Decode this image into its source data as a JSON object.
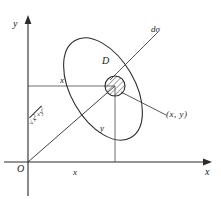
{
  "figure": {
    "type": "math-diagram",
    "axes": {
      "x_label": "x",
      "y_label": "y",
      "origin_label": "O"
    },
    "labels": {
      "region": "D",
      "area_element": "dσ",
      "point": "(x, y)",
      "x_projection": "x",
      "x_axis_segment": "x",
      "y_projection": "y",
      "radius_sqrt": "√",
      "radius_body_x": "x",
      "radius_body_y": "y",
      "radius_exp": "2",
      "radius_plus": "+",
      "radius_full": "√(x²+y²)"
    },
    "colors": {
      "stroke": "#2b2b2b",
      "thin_stroke": "#555555",
      "background": "#ffffff",
      "hatch": "#333333"
    },
    "geometry": {
      "origin": [
        28,
        162
      ],
      "point_xy": [
        115,
        86
      ],
      "ellipse_center": [
        103,
        89
      ],
      "ellipse_rx": 32,
      "ellipse_ry": 56,
      "ellipse_rotation_deg": -30,
      "element_circle_radius": 10,
      "x_axis_end": [
        212,
        162
      ],
      "y_axis_top": [
        28,
        18
      ]
    }
  }
}
